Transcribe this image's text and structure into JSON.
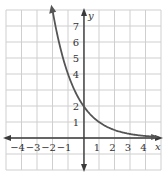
{
  "chart_data": {
    "type": "line",
    "title": "",
    "xlabel": "x",
    "ylabel": "y",
    "xlim": [
      -5,
      5
    ],
    "ylim": [
      -2,
      8
    ],
    "grid": true,
    "x_ticks": [
      "−4",
      "−3",
      "−2",
      "−1",
      "1",
      "2",
      "3",
      "4"
    ],
    "y_ticks": [
      "1",
      "2",
      "4",
      "5",
      "6",
      "7"
    ],
    "series": [
      {
        "name": "y = 2(1/2)^x",
        "x": [
          -2,
          -1.5,
          -1,
          -0.5,
          0,
          0.5,
          1,
          1.5,
          2,
          3,
          4,
          4.6
        ],
        "y": [
          8,
          5.66,
          4,
          2.83,
          2,
          1.41,
          1,
          0.71,
          0.5,
          0.25,
          0.125,
          0.08
        ]
      }
    ],
    "annotations": [
      "y-intercept at (0, 2)"
    ]
  }
}
